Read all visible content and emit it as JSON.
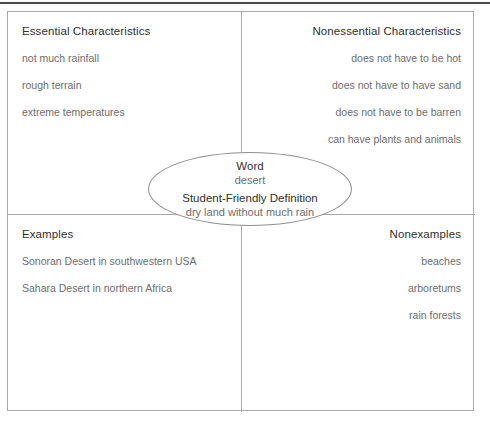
{
  "organizer": {
    "quadrants": {
      "essential": {
        "title": "Essential Characteristics",
        "items": [
          "not much rainfall",
          "rough terrain",
          "extreme temperatures"
        ]
      },
      "nonessential": {
        "title": "Nonessential Characteristics",
        "items": [
          "does not have to be hot",
          "does not have to have sand",
          "does not have to be barren",
          "can have plants and animals"
        ]
      },
      "examples": {
        "title": "Examples",
        "items": [
          "Sonoran Desert in southwestern USA",
          "Sahara Desert in northern Africa"
        ]
      },
      "nonexamples": {
        "title": "Nonexamples",
        "items": [
          "beaches",
          "arboretums",
          "rain forests"
        ]
      }
    },
    "center": {
      "word_label": "Word",
      "word_value": "desert",
      "definition_label": "Student-Friendly Definition",
      "definition_value": "dry land without much rain"
    },
    "colors": {
      "border": "#a8a8a8",
      "ellipse_border": "#8f8f8f",
      "title_text": "#2f2f2f",
      "body_text": "#6d6d6d",
      "top_rule": "#4a4a4a"
    }
  }
}
